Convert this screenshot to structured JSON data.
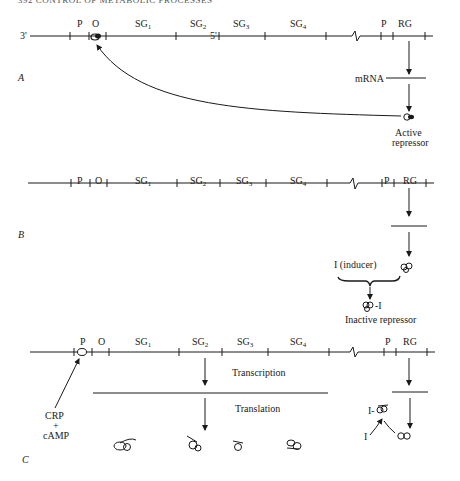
{
  "header": {
    "running_head": "392 CONTROL OF METABOLIC PROCESSES"
  },
  "strand": {
    "left_end": "3'",
    "right_end": "5'"
  },
  "gene_labels": {
    "promoter": "P",
    "operator": "O",
    "sg1": "SG",
    "sg1_sub": "1",
    "sg2": "SG",
    "sg2_sub": "2",
    "sg3": "SG",
    "sg3_sub": "3",
    "sg4": "SG",
    "sg4_sub": "4",
    "reg_promoter": "P",
    "regulator_gene": "RG"
  },
  "panels": [
    {
      "id": "A",
      "label": "A",
      "mrna_label": "mRNA",
      "repressor_label_line1": "Active",
      "repressor_label_line2": "repressor"
    },
    {
      "id": "B",
      "label": "B",
      "inducer_label": "I (inducer)",
      "complex_label": "-I",
      "inactive_label": "Inactive repressor"
    },
    {
      "id": "C",
      "label": "C",
      "crp_line1": "CRP",
      "crp_line2": "+",
      "crp_line3": "cAMP",
      "transcription_label": "Transcription",
      "translation_label": "Translation",
      "complex_label": "I-",
      "inducer_label": "I"
    }
  ],
  "colors": {
    "ink": "#1a1a1a",
    "background": "#ffffff"
  }
}
